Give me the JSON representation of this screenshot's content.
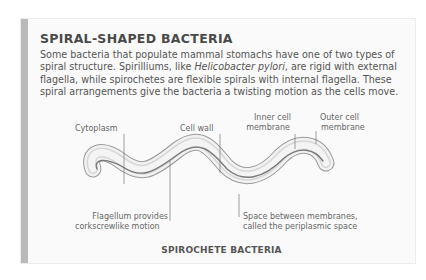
{
  "title": "SPIRAL-SHAPED BACTERIA",
  "body": {
    "part1": "Some bacteria that populate mammal stomachs have one of two types of spiral structure. Spirilliums, like ",
    "italic": "Helicobacter pylori",
    "part2": ", are rigid with external flagella, while spirochetes are flexible spirals with internal flagella. These spiral arrangements give the bacteria a twisting motion as the cells move."
  },
  "labels": {
    "cytoplasm": "Cytoplasm",
    "cell_wall": "Cell wall",
    "inner_membrane_1": "Inner cell",
    "inner_membrane_2": "membrane",
    "outer_membrane_1": "Outer cell",
    "outer_membrane_2": "membrane",
    "flagellum_1": "Flagellum provides",
    "flagellum_2": "corkscrewlike motion",
    "periplasm_1": "Space between membranes,",
    "periplasm_2": "called the periplasmic space"
  },
  "caption": "SPIROCHETE BACTERIA"
}
